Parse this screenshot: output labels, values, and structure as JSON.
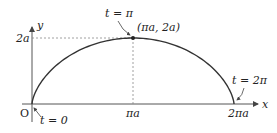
{
  "diagram": {
    "type": "cycloid-arch",
    "axes": {
      "x_label": "x",
      "y_label": "y",
      "origin_label": "O"
    },
    "ticks": {
      "y_tick": "2a",
      "x_mid": "πa",
      "x_end": "2πa"
    },
    "annotations": {
      "t_start": "t = 0",
      "t_peak": "t = π",
      "t_end": "t = 2π",
      "peak_point": "(πa, 2a)"
    },
    "colors": {
      "curve": "#333333",
      "axis": "#555555",
      "guide": "#888888"
    }
  }
}
